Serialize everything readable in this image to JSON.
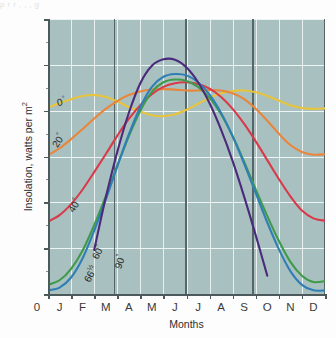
{
  "figure": {
    "caption_sliver": "p                      r    r   , , ,  g"
  },
  "axes": {
    "y_title_main": "Insolation, watts per m",
    "y_title_sup": "2",
    "x_title": "Months",
    "origin_label": "0",
    "y_ticks": [
      "600",
      "500",
      "400",
      "300",
      "200",
      "100",
      "0"
    ],
    "y_tick_values": [
      600,
      500,
      400,
      300,
      200,
      100,
      0
    ],
    "x_ticks": [
      "J",
      "F",
      "M",
      "A",
      "M",
      "J",
      "J",
      "A",
      "S",
      "O",
      "N",
      "D"
    ]
  },
  "annotations": [
    {
      "name": "label-0deg",
      "text": "0",
      "sup": "°",
      "color": "#e8c33c",
      "x": 57,
      "y": 96,
      "rot": -12
    },
    {
      "name": "label-20deg",
      "text": "20",
      "sup": "°",
      "color": "#e8863c",
      "x": 54,
      "y": 140,
      "rot": -58
    },
    {
      "name": "label-40deg",
      "text": "40",
      "sup": "°",
      "color": "#d83a4a",
      "x": 70,
      "y": 205,
      "rot": -58
    },
    {
      "name": "label-60deg",
      "text": "60",
      "sup": "°",
      "color": "#3f9a4a",
      "x": 94,
      "y": 252,
      "rot": -62
    },
    {
      "name": "label-66hdeg",
      "text": "66",
      "sup": "½",
      "color": "#2f7fb5",
      "x": 86,
      "y": 275,
      "rot": -62
    },
    {
      "name": "label-90deg",
      "text": "90",
      "sup": "°",
      "color": "#5a2d8a",
      "x": 117,
      "y": 262,
      "rot": -72
    }
  ],
  "colors": {
    "plot_background": "#a9c0c1",
    "gridline": "#f3f8f8",
    "axis": "#4c5a5c",
    "solstice_equinox_line": "#4e5b5e",
    "lat_0": "#e8c33c",
    "lat_20": "#e8863c",
    "lat_40": "#d83a4a",
    "lat_60": "#3f9a4a",
    "lat_66h": "#2f7fb5",
    "lat_90": "#4b2a7a"
  },
  "chart_data": {
    "type": "line",
    "title": "",
    "xlabel": "Months",
    "ylabel": "Insolation, watts per m2",
    "xlim": [
      0,
      12
    ],
    "ylim": [
      0,
      600
    ],
    "grid": true,
    "legend": "inline curve labels",
    "x": [
      0,
      0.5,
      1,
      1.5,
      2,
      2.5,
      3,
      3.5,
      4,
      4.5,
      5,
      5.5,
      6,
      6.5,
      7,
      7.5,
      8,
      8.5,
      9,
      9.5,
      10,
      10.5,
      11,
      11.5,
      12
    ],
    "x_tick_labels": [
      "J",
      "F",
      "M",
      "A",
      "M",
      "J",
      "J",
      "A",
      "S",
      "O",
      "N",
      "D"
    ],
    "vertical_markers": [
      {
        "label": "March equinox",
        "x": 2.85
      },
      {
        "label": "June solstice",
        "x": 5.95
      },
      {
        "label": "September equinox",
        "x": 8.85
      },
      {
        "label": "December solstice",
        "x": 11.95
      }
    ],
    "series": [
      {
        "name": "0° (Equator)",
        "color": "#e8c33c",
        "values": [
          407,
          416,
          425,
          432,
          434,
          430,
          420,
          408,
          398,
          390,
          388,
          392,
          402,
          415,
          428,
          438,
          443,
          444,
          440,
          432,
          422,
          412,
          406,
          404,
          405
        ]
      },
      {
        "name": "20° N",
        "color": "#e8863c",
        "values": [
          303,
          318,
          338,
          360,
          383,
          404,
          421,
          434,
          442,
          446,
          447,
          446,
          444,
          444,
          445,
          444,
          438,
          425,
          404,
          378,
          350,
          325,
          310,
          304,
          305
        ]
      },
      {
        "name": "40° N",
        "color": "#d83a4a",
        "values": [
          158,
          172,
          196,
          228,
          266,
          305,
          345,
          382,
          412,
          436,
          452,
          460,
          462,
          458,
          448,
          430,
          404,
          371,
          333,
          292,
          251,
          213,
          182,
          165,
          160
        ]
      },
      {
        "name": "60° N",
        "color": "#3f9a4a",
        "values": [
          20,
          30,
          55,
          95,
          150,
          213,
          280,
          344,
          400,
          441,
          462,
          468,
          465,
          452,
          428,
          392,
          344,
          288,
          228,
          170,
          116,
          70,
          40,
          26,
          28
        ]
      },
      {
        "name": "66½° N (Arctic Circle)",
        "color": "#2f7fb5",
        "values": [
          8,
          14,
          36,
          78,
          138,
          206,
          278,
          348,
          408,
          452,
          474,
          480,
          477,
          462,
          435,
          395,
          344,
          284,
          220,
          156,
          98,
          50,
          20,
          8,
          8
        ]
      },
      {
        "name": "90° N (North Pole)",
        "color": "#4b2a7a",
        "values": [
          0,
          0,
          0,
          0,
          96,
          210,
          310,
          395,
          460,
          498,
          512,
          511,
          494,
          462,
          416,
          358,
          290,
          212,
          128,
          40,
          0,
          0,
          0,
          0,
          0
        ]
      }
    ]
  }
}
